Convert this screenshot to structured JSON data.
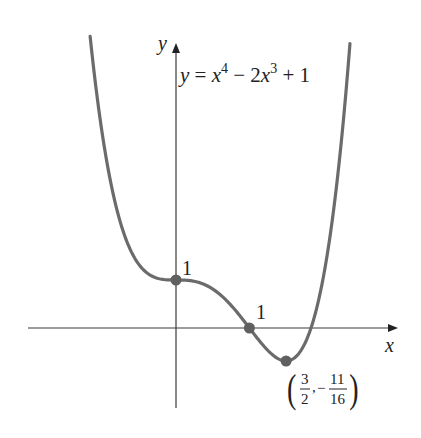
{
  "chart_data": {
    "type": "line",
    "title": "",
    "equation_label": "y = x⁴ − 2x³ + 1",
    "function": "x^4 - 2x^3 + 1",
    "xlabel": "x",
    "ylabel": "y",
    "xlim": [
      -1.17,
      2.37
    ],
    "ylim": [
      -0.69,
      5.75
    ],
    "grid": false,
    "legend": null,
    "series": [
      {
        "name": "y = x^4 - 2x^3 + 1",
        "x": [
          -1.17,
          -1.0,
          -0.75,
          -0.5,
          -0.25,
          0,
          0.25,
          0.5,
          0.75,
          1.0,
          1.25,
          1.5,
          1.75,
          1.84,
          2.0,
          2.25,
          2.37
        ],
        "y": [
          5.08,
          4.0,
          2.16,
          1.31,
          1.04,
          1.0,
          0.973,
          0.813,
          0.473,
          0.0,
          -0.465,
          -0.6875,
          -0.359,
          0.0,
          1.0,
          3.82,
          5.71
        ]
      }
    ],
    "marked_points": [
      {
        "x": 0,
        "y": 1,
        "label": "1"
      },
      {
        "x": 1,
        "y": 0,
        "label": "1"
      },
      {
        "x": 1.5,
        "y": -0.6875,
        "label": "(3/2, −11/16)",
        "label_num_x": "3",
        "label_den_x": "2",
        "label_num_y": "11",
        "label_den_y": "16"
      }
    ],
    "colors": {
      "curve": "#6b6b6b",
      "axis": "#3a3a3a",
      "points": "#606060"
    }
  },
  "labels": {
    "y_axis": "y",
    "x_axis": "x",
    "eq_y": "y",
    "eq_eq": " = ",
    "eq_x4": "x",
    "eq_exp4": "4",
    "eq_minus": " − 2",
    "eq_x3": "x",
    "eq_exp3": "3",
    "eq_plus1": " + 1",
    "p1": "1",
    "p2": "1",
    "min_lparen": "(",
    "min_num_x": "3",
    "min_den_x": "2",
    "min_comma": ",",
    "min_minus": "−",
    "min_num_y": "11",
    "min_den_y": "16",
    "min_rparen": ")"
  }
}
